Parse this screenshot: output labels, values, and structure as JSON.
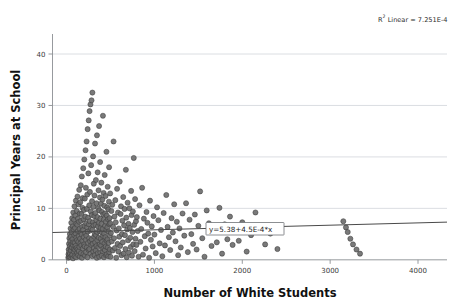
{
  "chart_data": {
    "type": "scatter",
    "title": "",
    "xlabel": "Number of White Students",
    "ylabel": "Principal Years at School",
    "xlim": [
      -160,
      4330
    ],
    "ylim": [
      -1.2,
      43.5
    ],
    "xticks": [
      0,
      1000,
      2000,
      3000,
      4000
    ],
    "xtick_labels": [
      "0",
      "1000",
      "2000",
      "3000",
      "4000"
    ],
    "yticks": [
      0,
      10,
      20,
      30,
      40
    ],
    "ytick_labels": [
      "0",
      "10",
      "20",
      "30",
      "40"
    ],
    "grid": "horizontal",
    "legend": "none",
    "marker": {
      "shape": "circle",
      "fill": "#6e6e6e",
      "edge": "#3c3c3c",
      "size_px": 3.3
    },
    "annotations": [
      {
        "name": "r-squared",
        "text_prefix": "R",
        "text_superscript": "2",
        "text_suffix": " Linear = 7.251E-4",
        "full_text": "R2 Linear = 7.251E-4",
        "x_px": 378,
        "y_px": 22
      },
      {
        "name": "fit-equation",
        "text": "y=5.38+4.5E-4*x",
        "x_px": 206,
        "y_px": 232
      }
    ],
    "fit_line": {
      "type": "linear",
      "equation": "y=5.38+4.5E-4*x",
      "intercept": 5.38,
      "slope": 0.00045,
      "r_squared": 0.0007251,
      "x_start": -160,
      "x_end": 4330,
      "color": "#4a4a4a"
    },
    "points": [
      [
        20,
        0.4
      ],
      [
        22,
        1.1
      ],
      [
        24,
        2.0
      ],
      [
        26,
        0.6
      ],
      [
        28,
        3.1
      ],
      [
        30,
        1.5
      ],
      [
        32,
        4.2
      ],
      [
        34,
        0.9
      ],
      [
        36,
        2.6
      ],
      [
        38,
        5.0
      ],
      [
        40,
        1.2
      ],
      [
        42,
        3.6
      ],
      [
        44,
        0.5
      ],
      [
        46,
        6.1
      ],
      [
        48,
        2.2
      ],
      [
        50,
        4.5
      ],
      [
        52,
        1.8
      ],
      [
        54,
        7.2
      ],
      [
        56,
        3.0
      ],
      [
        58,
        0.8
      ],
      [
        60,
        5.4
      ],
      [
        62,
        2.4
      ],
      [
        64,
        8.1
      ],
      [
        66,
        1.0
      ],
      [
        68,
        4.0
      ],
      [
        70,
        6.5
      ],
      [
        72,
        2.9
      ],
      [
        74,
        0.3
      ],
      [
        76,
        9.2
      ],
      [
        78,
        3.4
      ],
      [
        80,
        5.9
      ],
      [
        82,
        1.6
      ],
      [
        84,
        7.8
      ],
      [
        86,
        2.1
      ],
      [
        88,
        4.8
      ],
      [
        90,
        10.4
      ],
      [
        92,
        0.7
      ],
      [
        94,
        3.3
      ],
      [
        96,
        6.2
      ],
      [
        98,
        1.9
      ],
      [
        100,
        8.6
      ],
      [
        102,
        2.7
      ],
      [
        104,
        5.1
      ],
      [
        106,
        11.5
      ],
      [
        108,
        0.5
      ],
      [
        110,
        4.3
      ],
      [
        112,
        7.0
      ],
      [
        114,
        2.3
      ],
      [
        116,
        9.5
      ],
      [
        118,
        3.8
      ],
      [
        120,
        1.4
      ],
      [
        122,
        6.8
      ],
      [
        124,
        12.3
      ],
      [
        126,
        2.0
      ],
      [
        128,
        5.6
      ],
      [
        130,
        8.0
      ],
      [
        132,
        0.9
      ],
      [
        134,
        3.5
      ],
      [
        136,
        10.8
      ],
      [
        138,
        4.6
      ],
      [
        140,
        1.7
      ],
      [
        142,
        7.4
      ],
      [
        144,
        13.6
      ],
      [
        146,
        2.5
      ],
      [
        148,
        6.0
      ],
      [
        150,
        9.0
      ],
      [
        152,
        0.6
      ],
      [
        154,
        4.1
      ],
      [
        156,
        11.2
      ],
      [
        158,
        3.2
      ],
      [
        160,
        5.3
      ],
      [
        162,
        14.5
      ],
      [
        164,
        1.3
      ],
      [
        166,
        7.6
      ],
      [
        168,
        2.8
      ],
      [
        170,
        8.9
      ],
      [
        172,
        4.9
      ],
      [
        174,
        16.2
      ],
      [
        176,
        0.4
      ],
      [
        178,
        6.4
      ],
      [
        180,
        3.7
      ],
      [
        182,
        10.1
      ],
      [
        184,
        12.0
      ],
      [
        186,
        2.2
      ],
      [
        188,
        5.8
      ],
      [
        190,
        17.8
      ],
      [
        192,
        1.1
      ],
      [
        194,
        7.9
      ],
      [
        196,
        4.4
      ],
      [
        198,
        9.7
      ],
      [
        200,
        3.0
      ],
      [
        202,
        19.5
      ],
      [
        204,
        6.6
      ],
      [
        206,
        2.6
      ],
      [
        208,
        11.9
      ],
      [
        210,
        0.8
      ],
      [
        212,
        5.2
      ],
      [
        214,
        8.4
      ],
      [
        216,
        21.3
      ],
      [
        218,
        3.9
      ],
      [
        220,
        14.0
      ],
      [
        222,
        1.5
      ],
      [
        224,
        7.1
      ],
      [
        226,
        4.7
      ],
      [
        228,
        23.0
      ],
      [
        230,
        2.4
      ],
      [
        232,
        9.9
      ],
      [
        234,
        6.3
      ],
      [
        236,
        12.7
      ],
      [
        238,
        0.5
      ],
      [
        240,
        25.4
      ],
      [
        242,
        5.5
      ],
      [
        244,
        3.3
      ],
      [
        246,
        8.2
      ],
      [
        248,
        16.8
      ],
      [
        250,
        1.9
      ],
      [
        252,
        27.1
      ],
      [
        254,
        6.9
      ],
      [
        256,
        4.2
      ],
      [
        258,
        10.6
      ],
      [
        260,
        2.1
      ],
      [
        262,
        28.9
      ],
      [
        264,
        7.5
      ],
      [
        266,
        13.2
      ],
      [
        268,
        3.6
      ],
      [
        270,
        5.7
      ],
      [
        272,
        30.2
      ],
      [
        274,
        1.2
      ],
      [
        276,
        9.4
      ],
      [
        278,
        6.1
      ],
      [
        280,
        18.4
      ],
      [
        282,
        2.9
      ],
      [
        284,
        31.0
      ],
      [
        286,
        4.0
      ],
      [
        288,
        8.7
      ],
      [
        290,
        11.4
      ],
      [
        292,
        0.7
      ],
      [
        294,
        32.5
      ],
      [
        296,
        5.9
      ],
      [
        298,
        3.1
      ],
      [
        300,
        7.3
      ],
      [
        302,
        20.1
      ],
      [
        304,
        1.6
      ],
      [
        306,
        10.3
      ],
      [
        308,
        6.7
      ],
      [
        310,
        14.8
      ],
      [
        312,
        2.3
      ],
      [
        314,
        4.5
      ],
      [
        316,
        8.5
      ],
      [
        318,
        12.5
      ],
      [
        320,
        0.9
      ],
      [
        322,
        5.0
      ],
      [
        324,
        22.6
      ],
      [
        326,
        3.4
      ],
      [
        328,
        9.1
      ],
      [
        330,
        6.8
      ],
      [
        332,
        1.8
      ],
      [
        334,
        15.5
      ],
      [
        336,
        4.8
      ],
      [
        338,
        7.7
      ],
      [
        340,
        2.7
      ],
      [
        342,
        11.0
      ],
      [
        344,
        0.4
      ],
      [
        346,
        24.2
      ],
      [
        348,
        5.4
      ],
      [
        350,
        3.8
      ],
      [
        352,
        8.3
      ],
      [
        354,
        17.0
      ],
      [
        356,
        1.3
      ],
      [
        358,
        6.5
      ],
      [
        360,
        10.0
      ],
      [
        362,
        2.5
      ],
      [
        364,
        13.5
      ],
      [
        366,
        4.3
      ],
      [
        368,
        7.2
      ],
      [
        370,
        26.0
      ],
      [
        372,
        0.6
      ],
      [
        374,
        9.6
      ],
      [
        376,
        5.6
      ],
      [
        378,
        3.0
      ],
      [
        380,
        12.1
      ],
      [
        382,
        19.0
      ],
      [
        384,
        1.4
      ],
      [
        386,
        8.0
      ],
      [
        388,
        6.2
      ],
      [
        390,
        4.1
      ],
      [
        392,
        10.9
      ],
      [
        394,
        2.8
      ],
      [
        396,
        15.0
      ],
      [
        398,
        7.0
      ],
      [
        400,
        0.8
      ],
      [
        402,
        5.3
      ],
      [
        404,
        9.3
      ],
      [
        406,
        3.5
      ],
      [
        408,
        11.7
      ],
      [
        410,
        1.7
      ],
      [
        412,
        6.0
      ],
      [
        414,
        28.0
      ],
      [
        416,
        4.6
      ],
      [
        418,
        8.8
      ],
      [
        420,
        2.2
      ],
      [
        422,
        13.0
      ],
      [
        424,
        7.8
      ],
      [
        426,
        0.5
      ],
      [
        428,
        5.1
      ],
      [
        430,
        10.5
      ],
      [
        432,
        3.2
      ],
      [
        434,
        16.5
      ],
      [
        436,
        1.9
      ],
      [
        438,
        6.6
      ],
      [
        440,
        9.0
      ],
      [
        442,
        4.4
      ],
      [
        444,
        12.4
      ],
      [
        446,
        2.6
      ],
      [
        448,
        7.4
      ],
      [
        450,
        0.9
      ],
      [
        452,
        5.8
      ],
      [
        454,
        21.0
      ],
      [
        456,
        3.7
      ],
      [
        458,
        8.6
      ],
      [
        460,
        1.1
      ],
      [
        462,
        10.2
      ],
      [
        464,
        6.3
      ],
      [
        466,
        4.0
      ],
      [
        468,
        14.2
      ],
      [
        470,
        2.4
      ],
      [
        472,
        7.9
      ],
      [
        474,
        0.7
      ],
      [
        476,
        9.8
      ],
      [
        478,
        5.5
      ],
      [
        480,
        3.3
      ],
      [
        482,
        11.3
      ],
      [
        484,
        18.0
      ],
      [
        486,
        1.5
      ],
      [
        488,
        6.9
      ],
      [
        490,
        8.1
      ],
      [
        492,
        4.7
      ],
      [
        494,
        2.0
      ],
      [
        496,
        12.9
      ],
      [
        498,
        7.1
      ],
      [
        500,
        0.6
      ],
      [
        505,
        5.2
      ],
      [
        510,
        9.5
      ],
      [
        515,
        3.6
      ],
      [
        520,
        10.7
      ],
      [
        525,
        1.8
      ],
      [
        530,
        6.4
      ],
      [
        535,
        23.0
      ],
      [
        540,
        4.2
      ],
      [
        545,
        8.4
      ],
      [
        550,
        2.3
      ],
      [
        555,
        11.6
      ],
      [
        560,
        7.3
      ],
      [
        565,
        0.4
      ],
      [
        570,
        5.7
      ],
      [
        575,
        13.8
      ],
      [
        580,
        3.1
      ],
      [
        585,
        9.2
      ],
      [
        590,
        1.6
      ],
      [
        595,
        6.1
      ],
      [
        600,
        4.5
      ],
      [
        605,
        15.2
      ],
      [
        610,
        2.7
      ],
      [
        615,
        8.9
      ],
      [
        620,
        10.4
      ],
      [
        625,
        0.9
      ],
      [
        630,
        5.0
      ],
      [
        635,
        7.6
      ],
      [
        640,
        3.4
      ],
      [
        645,
        12.2
      ],
      [
        650,
        1.2
      ],
      [
        655,
        6.7
      ],
      [
        660,
        9.9
      ],
      [
        665,
        4.8
      ],
      [
        670,
        2.1
      ],
      [
        675,
        17.5
      ],
      [
        680,
        8.2
      ],
      [
        685,
        0.5
      ],
      [
        690,
        5.9
      ],
      [
        695,
        11.1
      ],
      [
        700,
        3.8
      ],
      [
        705,
        7.0
      ],
      [
        710,
        1.4
      ],
      [
        715,
        10.0
      ],
      [
        720,
        6.2
      ],
      [
        725,
        4.3
      ],
      [
        730,
        2.5
      ],
      [
        735,
        13.4
      ],
      [
        740,
        8.7
      ],
      [
        745,
        0.8
      ],
      [
        750,
        5.4
      ],
      [
        755,
        9.4
      ],
      [
        760,
        3.0
      ],
      [
        765,
        19.8
      ],
      [
        770,
        6.8
      ],
      [
        775,
        1.7
      ],
      [
        780,
        11.8
      ],
      [
        785,
        4.1
      ],
      [
        790,
        7.5
      ],
      [
        795,
        2.9
      ],
      [
        800,
        8.3
      ],
      [
        810,
        5.6
      ],
      [
        820,
        0.6
      ],
      [
        830,
        10.6
      ],
      [
        840,
        3.5
      ],
      [
        850,
        6.0
      ],
      [
        860,
        14.0
      ],
      [
        870,
        1.0
      ],
      [
        880,
        8.0
      ],
      [
        890,
        4.6
      ],
      [
        900,
        2.2
      ],
      [
        910,
        9.3
      ],
      [
        920,
        7.2
      ],
      [
        930,
        5.1
      ],
      [
        940,
        0.4
      ],
      [
        950,
        11.5
      ],
      [
        960,
        3.9
      ],
      [
        970,
        6.5
      ],
      [
        980,
        2.6
      ],
      [
        990,
        8.5
      ],
      [
        1000,
        4.9
      ],
      [
        1015,
        1.3
      ],
      [
        1030,
        10.2
      ],
      [
        1045,
        7.7
      ],
      [
        1060,
        3.2
      ],
      [
        1075,
        5.8
      ],
      [
        1090,
        0.7
      ],
      [
        1105,
        9.1
      ],
      [
        1120,
        2.8
      ],
      [
        1135,
        12.6
      ],
      [
        1150,
        6.4
      ],
      [
        1165,
        4.4
      ],
      [
        1180,
        1.9
      ],
      [
        1195,
        8.1
      ],
      [
        1210,
        5.3
      ],
      [
        1225,
        10.8
      ],
      [
        1240,
        3.6
      ],
      [
        1255,
        7.4
      ],
      [
        1270,
        0.9
      ],
      [
        1285,
        6.1
      ],
      [
        1300,
        2.4
      ],
      [
        1320,
        9.0
      ],
      [
        1340,
        4.7
      ],
      [
        1360,
        11.0
      ],
      [
        1380,
        1.5
      ],
      [
        1400,
        7.8
      ],
      [
        1420,
        5.0
      ],
      [
        1440,
        3.1
      ],
      [
        1460,
        8.8
      ],
      [
        1480,
        2.0
      ],
      [
        1500,
        6.6
      ],
      [
        1520,
        13.3
      ],
      [
        1545,
        4.2
      ],
      [
        1570,
        0.6
      ],
      [
        1595,
        9.6
      ],
      [
        1620,
        7.1
      ],
      [
        1650,
        2.7
      ],
      [
        1680,
        5.5
      ],
      [
        1710,
        3.4
      ],
      [
        1740,
        10.1
      ],
      [
        1770,
        1.2
      ],
      [
        1800,
        6.9
      ],
      [
        1830,
        4.0
      ],
      [
        1860,
        8.4
      ],
      [
        1890,
        2.9
      ],
      [
        1920,
        5.7
      ],
      [
        1960,
        3.7
      ],
      [
        2000,
        7.3
      ],
      [
        2050,
        1.6
      ],
      [
        2100,
        4.8
      ],
      [
        2150,
        9.2
      ],
      [
        2200,
        6.2
      ],
      [
        2260,
        3.0
      ],
      [
        2320,
        5.1
      ],
      [
        2400,
        2.1
      ],
      [
        3150,
        7.5
      ],
      [
        3180,
        6.3
      ],
      [
        3200,
        5.4
      ],
      [
        3230,
        4.1
      ],
      [
        3260,
        3.0
      ],
      [
        3300,
        2.0
      ],
      [
        3340,
        1.2
      ]
    ]
  }
}
